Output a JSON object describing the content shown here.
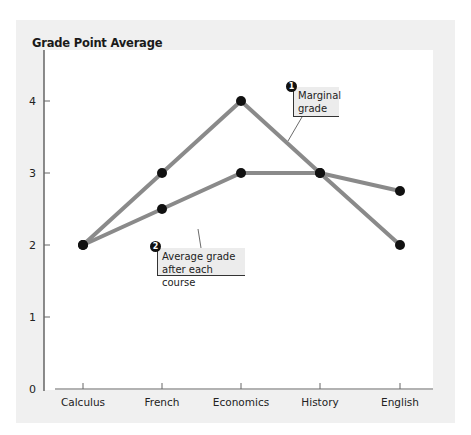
{
  "chart_data": {
    "type": "line",
    "title": "Grade Point Average",
    "xlabel": "",
    "ylabel": "Grade Point Average",
    "categories": [
      "Calculus",
      "French",
      "Economics",
      "History",
      "English"
    ],
    "series": [
      {
        "name": "Marginal grade",
        "values": [
          2,
          3,
          4,
          3,
          2
        ]
      },
      {
        "name": "Average grade after each course",
        "values": [
          2,
          2.5,
          3,
          3,
          2.75
        ]
      }
    ],
    "ylim": [
      0,
      4.5
    ],
    "yticks": [
      0,
      1,
      2,
      3,
      4
    ],
    "grid": false,
    "legend": "inline callouts"
  },
  "header": {
    "title": "Grade Point Average"
  },
  "axes": {
    "yticks": [
      "0",
      "1",
      "2",
      "3",
      "4"
    ],
    "xticks": [
      "Calculus",
      "French",
      "Economics",
      "History",
      "English"
    ]
  },
  "callouts": [
    {
      "number": "1",
      "line1": "Marginal",
      "line2": "grade"
    },
    {
      "number": "2",
      "line1": "Average grade",
      "line2": "after each course"
    }
  ],
  "colors": {
    "line": "#8a8a8a",
    "marker": "#111111",
    "panel": "#f0f0f0",
    "axis": "#555555"
  }
}
